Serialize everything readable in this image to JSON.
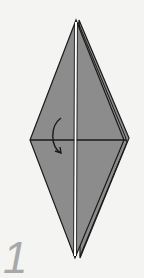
{
  "diagram": {
    "step_number": "1",
    "shape": "kite / bird base diamond",
    "fill_color": "#8c8c8c",
    "stroke_color": "#1a1a1a",
    "background_color": "#f4f4f2",
    "annotations": [
      "curved fold arrow indicating flap folds down over horizontal crease"
    ]
  }
}
